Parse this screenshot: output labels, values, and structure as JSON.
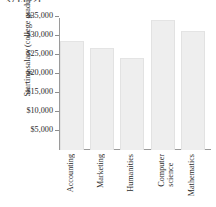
{
  "top_caption": "37  (5.22)",
  "chart_data": {
    "type": "bar",
    "title": "",
    "subtitle": "",
    "xlabel": "",
    "ylabel": "Starting salary (college graduates)",
    "categories": [
      "Accounting",
      "Marketing",
      "Humanities",
      "Computer\nscience",
      "Mathematics"
    ],
    "values": [
      28500,
      26500,
      24000,
      34000,
      31000
    ],
    "ytick_labels": [
      "$35,000",
      "$30,000",
      "$25,000",
      "$20,000",
      "$15,000",
      "$10,000",
      "$5,000"
    ],
    "ytick_values": [
      35000,
      30000,
      25000,
      20000,
      15000,
      10000,
      5000
    ],
    "ylim": [
      0,
      37500
    ],
    "grid": false,
    "legend": null,
    "bar_color": "#eeeeee",
    "axis_color": "#9a9a9a",
    "text_color": "#2b2b2b"
  }
}
